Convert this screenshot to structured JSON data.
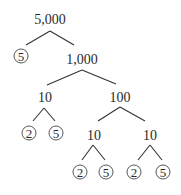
{
  "diagram": {
    "type": "factor-tree",
    "root": "5,000",
    "nodes": {
      "n_root": {
        "label": "5,000",
        "prime": false
      },
      "n_5a": {
        "label": "5",
        "prime": true
      },
      "n_1000": {
        "label": "1,000",
        "prime": false
      },
      "n_10a": {
        "label": "10",
        "prime": false
      },
      "n_100": {
        "label": "100",
        "prime": false
      },
      "n_2a": {
        "label": "2",
        "prime": true
      },
      "n_5b": {
        "label": "5",
        "prime": true
      },
      "n_10b": {
        "label": "10",
        "prime": false
      },
      "n_10c": {
        "label": "10",
        "prime": false
      },
      "n_2b": {
        "label": "2",
        "prime": true
      },
      "n_5c": {
        "label": "5",
        "prime": true
      },
      "n_2c": {
        "label": "2",
        "prime": true
      },
      "n_5d": {
        "label": "5",
        "prime": true
      }
    },
    "edges": [
      [
        "5,000",
        "5"
      ],
      [
        "5,000",
        "1,000"
      ],
      [
        "1,000",
        "10"
      ],
      [
        "1,000",
        "100"
      ],
      [
        "10",
        "2"
      ],
      [
        "10",
        "5"
      ],
      [
        "100",
        "10"
      ],
      [
        "100",
        "10"
      ],
      [
        "10",
        "2"
      ],
      [
        "10",
        "5"
      ],
      [
        "10",
        "2"
      ],
      [
        "10",
        "5"
      ]
    ],
    "colors": {
      "ink": "#2a2a2a",
      "background": "#ffffff"
    }
  }
}
